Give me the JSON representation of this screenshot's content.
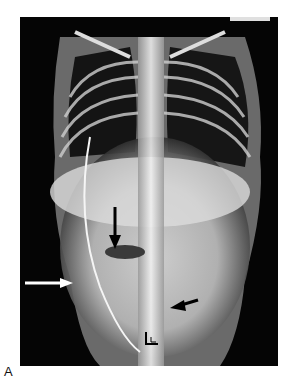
{
  "figure": {
    "panel_label": "A",
    "image_type": "frontal radiograph of infant chest and abdomen",
    "annotations": [
      {
        "name": "black-arrow-down",
        "description": "black arrow pointing down at air-fluid level",
        "color": "#000000"
      },
      {
        "name": "white-arrow-right",
        "description": "white arrow pointing right at right flank",
        "color": "#ffffff"
      },
      {
        "name": "black-arrow-left",
        "description": "black arrow pointing left in lower abdomen",
        "color": "#000000"
      },
      {
        "name": "open-arrowhead",
        "description": "open arrowhead pointing up-left near pelvis",
        "color": "#000000"
      }
    ],
    "colors": {
      "background": "#050505",
      "bone": "#e8e8e8",
      "border": "#ffffff"
    }
  }
}
